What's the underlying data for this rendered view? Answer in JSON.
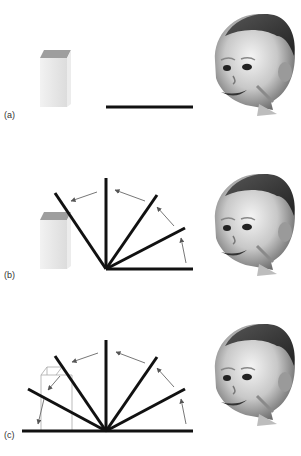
{
  "figure": {
    "colors": {
      "beam": "#111111",
      "arrow": "#777777",
      "box_top": "#9a9a9a",
      "box_front": "#e2e2e2",
      "box_side": "#f0f0f0",
      "box_outline": "#a9a9a9"
    },
    "panels": [
      {
        "label": "(a)",
        "description": "Box behind flat screen; infant watching"
      },
      {
        "label": "(b)",
        "description": "Screen rotates 120 degrees, stopping before box"
      },
      {
        "label": "(c)",
        "description": "Screen rotates 180 degrees through box location (impossible event)"
      }
    ]
  }
}
